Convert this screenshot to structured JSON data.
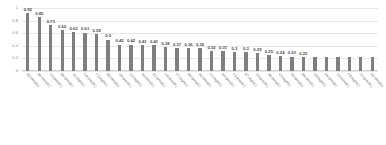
{
  "chart_data": {
    "type": "bar",
    "title": "",
    "xlabel": "",
    "ylabel": "",
    "ylim": [
      0,
      1
    ],
    "grid": true,
    "legend": false,
    "bar_color": "#7f7f7f",
    "yticks": [
      "1",
      "0.8",
      "0.6",
      "0.4",
      "0.2",
      "0"
    ],
    "ytick_values": [
      1,
      0.8,
      0.6,
      0.4,
      0.2,
      0
    ],
    "categories": [
      "B2 (nmol/L)",
      "B5 (nmol/L)",
      "C6 (pmol/L)",
      "B6 (pmol/L)",
      "A1 (ng/mL)",
      "C8 (nmol/L)",
      "F2 (ng/mL)",
      "B3 (nmol/L)",
      "D4 (pmol/L)",
      "C2 (ng/mL)",
      "A5 (nmol/L)",
      "E1 (pmol/L)",
      "C4 (nmol/L)",
      "D7 (ng/mL)",
      "B9 (pmol/L)",
      "A3 (nmol/L)",
      "C1 (ng/mL)",
      "E6 (pmol/L)",
      "F5 (nmol/L)",
      "B7 (ng/mL)",
      "D2 (pmol/L)",
      "A8 (nmol/L)",
      "C5 (ng/mL)",
      "E3 (pmol/L)",
      "B4 (nmol/L)",
      "D9 (ng/mL)",
      "A6 (pmol/L)",
      "C3 (nmol/L)",
      "F8 (ng/mL)",
      "D1 (pmol/L)",
      "E5 (nmol/L)"
    ],
    "values": [
      0.92,
      0.85,
      0.73,
      0.65,
      0.62,
      0.61,
      0.58,
      0.5,
      0.42,
      0.42,
      0.41,
      0.41,
      0.38,
      0.37,
      0.36,
      0.36,
      0.32,
      0.31,
      0.3,
      0.3,
      0.29,
      0.25,
      0.24,
      0.23,
      0.22,
      0.22,
      0.22,
      0.22,
      0.22,
      0.22,
      0.22
    ],
    "value_labels": [
      "0.92",
      "0.85",
      "0.73",
      "0.65",
      "0.62",
      "0.61",
      "0.58",
      "0.5",
      "0.42",
      "0.42",
      "0.41",
      "0.41",
      "0.38",
      "0.37",
      "0.36",
      "0.36",
      "0.32",
      "0.31",
      "0.3",
      "0.3",
      "0.29",
      "0.25",
      "0.24",
      "0.23",
      "0.22",
      "",
      "",
      "",
      "",
      "",
      ""
    ]
  }
}
